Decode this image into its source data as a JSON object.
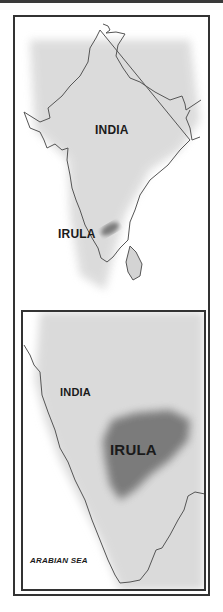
{
  "map_main": {
    "labels": {
      "country": "INDIA",
      "region": "IRULA"
    }
  },
  "map_inset": {
    "labels": {
      "country": "INDIA",
      "region": "IRULA",
      "sea": "ARABIAN SEA"
    }
  },
  "colors": {
    "land": "#d9d9d9",
    "border_line": "#555555",
    "highlight": "#7a7a7a",
    "frame": "#333333"
  }
}
